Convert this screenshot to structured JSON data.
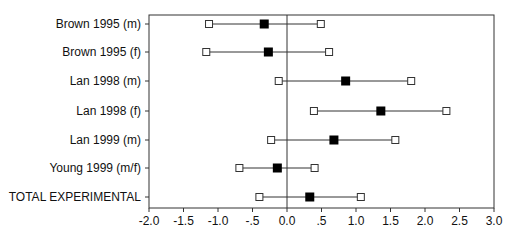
{
  "chart_data": {
    "type": "forest",
    "title": "",
    "xlabel": "",
    "ylabel": "",
    "xlim": [
      -2.0,
      3.0
    ],
    "x_ticks": [
      "-2.0",
      "-1.5",
      "-1.0",
      "-.5",
      "0.0",
      ".5",
      "1.0",
      "1.5",
      "2.0",
      "2.5",
      "3.0"
    ],
    "x_tick_values": [
      -2.0,
      -1.5,
      -1.0,
      -0.5,
      0.0,
      0.5,
      1.0,
      1.5,
      2.0,
      2.5,
      3.0
    ],
    "reference_line": 0.0,
    "grid": false,
    "categories": [
      "Brown 1995 (m)",
      "Brown 1995 (f)",
      "Lan 1998 (m)",
      "Lan 1998 (f)",
      "Lan 1999 (m)",
      "Young 1999 (m/f)",
      "TOTAL EXPERIMENTAL"
    ],
    "series": [
      {
        "name": "estimate",
        "values": [
          -0.33,
          -0.27,
          0.85,
          1.36,
          0.68,
          -0.14,
          0.33
        ]
      },
      {
        "name": "lower",
        "values": [
          -1.13,
          -1.17,
          -0.12,
          0.39,
          -0.23,
          -0.69,
          -0.4
        ]
      },
      {
        "name": "upper",
        "values": [
          0.49,
          0.61,
          1.8,
          2.31,
          1.57,
          0.4,
          1.07
        ]
      }
    ]
  },
  "colors": {
    "point": "#000000",
    "ci_end": "#ffffff",
    "line": "#333333"
  }
}
